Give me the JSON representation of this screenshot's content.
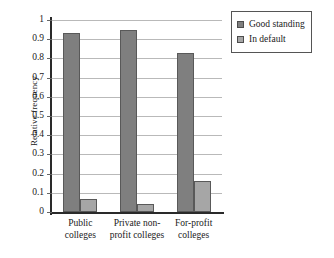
{
  "chart_data": {
    "type": "bar",
    "title": "",
    "subtitle": "",
    "xlabel": "",
    "ylabel": "Relative frequency",
    "ylim": [
      0,
      1
    ],
    "ytick_step": 0.1,
    "ytick_labels": [
      "1",
      "0.9",
      "0.8",
      "0.7",
      "0.6",
      "0.5",
      "0.4",
      "0.3",
      "0.2",
      "0.1",
      "0"
    ],
    "ytick_values": [
      1,
      0.9,
      0.8,
      0.7,
      0.6,
      0.5,
      0.4,
      0.3,
      0.2,
      0.1,
      0
    ],
    "grid": true,
    "grid_axis": "y",
    "legend_position": "right-top",
    "categories": [
      "Public colleges",
      "Private non-profit colleges",
      "For-profit colleges"
    ],
    "series": [
      {
        "name": "Good standing",
        "color": "#7f7f7f",
        "values": [
          0.93,
          0.95,
          0.83
        ]
      },
      {
        "name": "In default",
        "color": "#a6a6a6",
        "values": [
          0.07,
          0.04,
          0.16
        ]
      }
    ],
    "colors": {
      "good_standing": "#7f7f7f",
      "in_default": "#a6a6a6",
      "axis": "#2a2a2a",
      "gridline": "#b9b9b9",
      "background": "#ffffff"
    }
  },
  "legend": {
    "items": [
      {
        "label": "Good standing"
      },
      {
        "label": "In default"
      }
    ]
  }
}
